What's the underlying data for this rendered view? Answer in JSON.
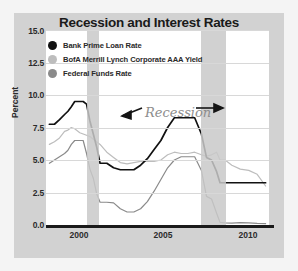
{
  "chart": {
    "title": "Recession and Interest Rates",
    "ylabel": "Percent",
    "annotation": "Recession"
  },
  "legend": [
    {
      "label": "Bank Prime Loan Rate",
      "color": "#111111",
      "marker": "legend-dot-prime"
    },
    {
      "label": "BofA Merrill Lynch Corporate AAA Yield",
      "color": "#bdbdbd",
      "marker": "legend-dot-aaa"
    },
    {
      "label": "Federal Funds Rate",
      "color": "#8a8a8a",
      "marker": "legend-dot-ffr"
    }
  ],
  "axis": {
    "yticks": [
      "15.0",
      "12.5",
      "10.0",
      "7.5",
      "5.0",
      "2.5",
      "0.0"
    ],
    "xticks": [
      "2000",
      "2005",
      "2010"
    ]
  },
  "chart_data": {
    "type": "line",
    "title": "Recession and Interest Rates",
    "xlabel": "",
    "ylabel": "Percent",
    "ylim": [
      0.0,
      15.0
    ],
    "xlim": [
      1998.8,
      2012.0
    ],
    "grid": true,
    "legend_position": "top-left",
    "yticks": [
      0.0,
      2.5,
      5.0,
      7.5,
      10.0,
      12.5,
      15.0
    ],
    "xticks": [
      2000,
      2005,
      2010
    ],
    "annotations": [
      {
        "text": "Recession",
        "x": 2003.4,
        "y": 8.9,
        "style": "italic-script",
        "color": "#8d8d8d"
      },
      {
        "text": "arrow-left",
        "x_from": 2003.0,
        "x_to": 2001.6,
        "y": 8.6
      },
      {
        "text": "arrow-right",
        "x_from": 2004.6,
        "x_to": 2007.9,
        "y": 8.6
      }
    ],
    "shaded_regions": [
      {
        "label": "Recession 2001",
        "x_start": 2001.2,
        "x_end": 2001.92,
        "color": "#c9c9c9"
      },
      {
        "label": "Recession 2007-2009",
        "x_start": 2007.95,
        "x_end": 2009.5,
        "color": "#c9c9c9"
      }
    ],
    "x": [
      1999.0,
      1999.3,
      1999.6,
      1999.9,
      2000.1,
      2000.3,
      2000.5,
      2000.8,
      2001.0,
      2001.2,
      2001.4,
      2001.6,
      2001.8,
      2002.0,
      2002.4,
      2002.8,
      2003.2,
      2003.6,
      2004.0,
      2004.4,
      2004.8,
      2005.2,
      2005.6,
      2006.0,
      2006.4,
      2006.8,
      2007.2,
      2007.6,
      2008.0,
      2008.3,
      2008.6,
      2008.9,
      2009.1,
      2009.4,
      2009.8,
      2010.3,
      2010.8,
      2011.3,
      2011.8
    ],
    "series": [
      {
        "name": "Bank Prime Loan Rate",
        "color": "#111111",
        "values": [
          7.75,
          7.75,
          8.1,
          8.5,
          8.75,
          9.1,
          9.5,
          9.5,
          9.5,
          9.3,
          8.0,
          7.0,
          6.0,
          4.75,
          4.75,
          4.4,
          4.25,
          4.25,
          4.25,
          4.6,
          5.1,
          5.8,
          6.5,
          7.5,
          8.25,
          8.25,
          8.25,
          8.25,
          7.0,
          5.2,
          5.0,
          4.1,
          3.25,
          3.25,
          3.25,
          3.25,
          3.25,
          3.25,
          3.25
        ]
      },
      {
        "name": "BofA Merrill Lynch Corporate AAA Yield",
        "color": "#bdbdbd",
        "values": [
          6.2,
          6.4,
          6.7,
          7.2,
          7.3,
          7.5,
          7.4,
          7.1,
          7.0,
          6.9,
          6.8,
          6.6,
          6.4,
          6.2,
          5.6,
          5.2,
          4.8,
          4.7,
          4.8,
          4.9,
          4.9,
          4.9,
          5.0,
          5.4,
          5.6,
          5.5,
          5.5,
          5.6,
          5.4,
          5.3,
          5.4,
          5.6,
          5.0,
          5.0,
          4.6,
          4.3,
          4.2,
          3.9,
          3.0
        ]
      },
      {
        "name": "Federal Funds Rate",
        "color": "#8a8a8a",
        "values": [
          4.75,
          5.0,
          5.25,
          5.5,
          5.75,
          6.2,
          6.5,
          6.5,
          6.5,
          5.5,
          4.3,
          3.6,
          2.4,
          1.75,
          1.75,
          1.7,
          1.25,
          1.0,
          1.0,
          1.25,
          1.8,
          2.6,
          3.5,
          4.4,
          5.0,
          5.25,
          5.25,
          5.25,
          4.2,
          2.2,
          2.0,
          0.9,
          0.2,
          0.16,
          0.14,
          0.18,
          0.17,
          0.12,
          0.1
        ]
      }
    ]
  }
}
